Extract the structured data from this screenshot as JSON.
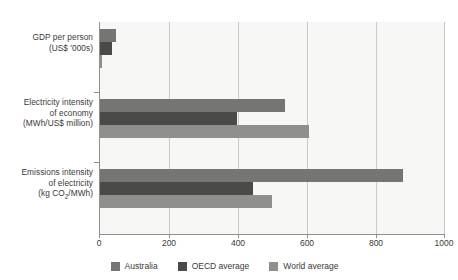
{
  "chart_data": {
    "type": "bar",
    "orientation": "horizontal",
    "title": "",
    "xlabel": "",
    "ylabel": "",
    "xlim": [
      0,
      1000
    ],
    "xticks": [
      0,
      200,
      400,
      600,
      800,
      1000
    ],
    "grid": true,
    "legend_position": "bottom",
    "categories": [
      "GDP per person (US$ '000s)",
      "Electricity intensity of economy (MWh/US$ million)",
      "Emissions intensity of electricity (kg CO2/MWh)"
    ],
    "series": [
      {
        "name": "Australia",
        "color": "#757573",
        "values": [
          48,
          540,
          880
        ]
      },
      {
        "name": "OECD average",
        "color": "#4a4a48",
        "values": [
          38,
          400,
          445
        ]
      },
      {
        "name": "World average",
        "color": "#8f8f8d",
        "values": [
          10,
          610,
          500
        ]
      }
    ]
  },
  "axis": {
    "x_tick_labels": [
      "0",
      "200",
      "400",
      "600",
      "800",
      "1000"
    ],
    "categories": [
      {
        "lines": [
          "GDP per person",
          "(US$ '000s)"
        ]
      },
      {
        "lines": [
          "Electricity intensity",
          "of economy",
          "(MWh/US$ million)"
        ]
      },
      {
        "lines": [
          "Emissions intensity",
          "of electricity",
          "(kg CO",
          "/MWh)"
        ]
      }
    ]
  },
  "legend": {
    "items": [
      {
        "label": "Australia"
      },
      {
        "label": "OECD average"
      },
      {
        "label": "World average"
      }
    ]
  },
  "header": {
    "clipped_title": ""
  }
}
